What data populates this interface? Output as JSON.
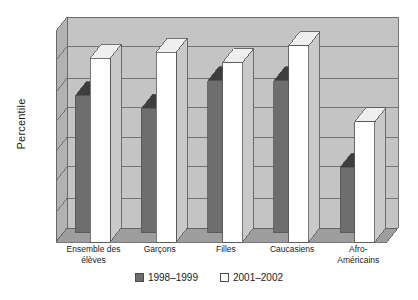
{
  "chart_data": {
    "type": "bar",
    "title": "",
    "subtitle": "",
    "xlabel": "",
    "ylabel": "Percentile",
    "ylim": [
      0,
      100
    ],
    "grid": true,
    "grid_lines": [
      14,
      29,
      43,
      57,
      71,
      86
    ],
    "legend_position": "bottom",
    "style": "3d-clustered-columns",
    "categories": [
      "Ensemble des\nélèves",
      "Garçons",
      "Filles",
      "Caucasiens",
      "Afro-\nAméricains"
    ],
    "series": [
      {
        "name": "1998–1999",
        "color": "#6e6e6e",
        "values": [
          65,
          59,
          72,
          72,
          31
        ]
      },
      {
        "name": "2001–2002",
        "color": "#ffffff",
        "values": [
          87,
          90,
          85,
          93,
          57
        ]
      }
    ],
    "axis_ticks_labeled": false,
    "tick_count": 7
  },
  "legend": {
    "items": [
      {
        "label": "1998–1999",
        "marker": "filled-square"
      },
      {
        "label": "2001–2002",
        "marker": "empty-square"
      }
    ]
  },
  "colors": {
    "bar_dark_front": "#6e6e6e",
    "bar_dark_side": "#4f4f4f",
    "bar_dark_top": "#3e3e3e",
    "bar_light_front": "#ffffff",
    "bar_light_side": "#c9c9c9",
    "bar_light_top": "#efefef",
    "wall_back": "#c4c4c4",
    "wall_side": "#b2b2b2",
    "floor": "#9e9e9e",
    "gridline": "#6a6a6a",
    "text": "#1a1a1a"
  }
}
